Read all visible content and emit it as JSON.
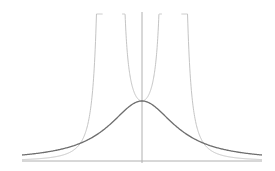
{
  "diagram": {
    "title": "",
    "colors": {
      "background": "#ffffff",
      "axes": "#b0b0b0",
      "bell_curve": "#6e6e6e",
      "other_curves": "#c4c4c4"
    },
    "axes": {
      "x_range": [
        -3,
        3
      ],
      "y_range": [
        0,
        2.4
      ]
    },
    "curves": [
      {
        "name": "bell",
        "formula": "1/(1+x^2)",
        "emphasis": "dark"
      },
      {
        "name": "inner-u",
        "formula": "1/(1-(x/0.55)^2)",
        "domain": [
          -0.55,
          0.55
        ],
        "emphasis": "light"
      },
      {
        "name": "outer-left",
        "formula": "0.08/(x+0.75)^2 branch",
        "emphasis": "light"
      },
      {
        "name": "outer-right",
        "formula": "0.08/(x-0.75)^2 branch",
        "emphasis": "light"
      }
    ]
  }
}
